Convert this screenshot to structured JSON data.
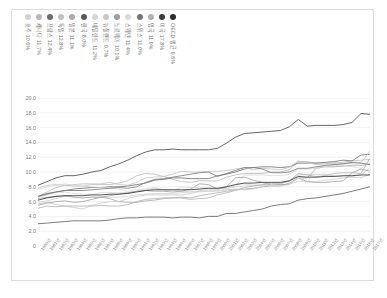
{
  "chart_data": {
    "type": "line",
    "title": "",
    "xlabel": "",
    "ylabel": "",
    "ylim": [
      0,
      20
    ],
    "ytick_labels": [
      "20.0",
      "18.0",
      "16.0",
      "14.0",
      "12.0",
      "10.0",
      "8.0",
      "6.0",
      "4.0",
      "2.0",
      "0"
    ],
    "ytick_values": [
      20,
      18,
      16,
      14,
      12,
      10,
      8,
      6,
      4,
      2,
      0
    ],
    "grid": true,
    "legend_position": "top",
    "x": [
      1980,
      1981,
      1982,
      1983,
      1984,
      1985,
      1986,
      1987,
      1988,
      1989,
      1990,
      1991,
      1992,
      1993,
      1994,
      1995,
      1996,
      1997,
      1998,
      1999,
      2000,
      2001,
      2002,
      2003,
      2004,
      2005,
      2006,
      2007,
      2008,
      2009,
      2010,
      2011,
      2012,
      2013,
      2014,
      2015,
      2016,
      2017
    ],
    "xtick_labels": [
      "1980년",
      "1981년",
      "1982년",
      "1983년",
      "1984년",
      "1985년",
      "1986년",
      "1987년",
      "1988년",
      "1989년",
      "1990년",
      "1991년",
      "1992년",
      "1993년",
      "1994년",
      "1995년",
      "1996년",
      "1997년",
      "1998년",
      "1999년",
      "2000년",
      "2001년",
      "2002년",
      "2003년",
      "2004년",
      "2005년",
      "2006년",
      "2007년",
      "2008년",
      "2009년",
      "2010년",
      "2011년",
      "2012년",
      "2013년",
      "2014년",
      "2015년",
      "2016년",
      "2017년"
    ],
    "series": [
      {
        "name": "호주",
        "label": "호주 10.6%",
        "color": "#d0d0d0",
        "final_value": 10.6,
        "values": [
          5.9,
          6.1,
          6.4,
          6.7,
          6.6,
          6.5,
          6.6,
          6.6,
          6.6,
          6.6,
          6.7,
          6.9,
          7.0,
          7.1,
          7.1,
          7.1,
          7.2,
          7.3,
          7.5,
          7.6,
          7.7,
          7.8,
          8.0,
          8.1,
          8.2,
          8.2,
          8.3,
          8.3,
          8.4,
          8.7,
          8.7,
          8.7,
          8.9,
          9.0,
          9.2,
          9.4,
          9.6,
          10.6
        ]
      },
      {
        "name": "캐나다",
        "label": "캐나다 11.7%",
        "color": "#b9b9b9",
        "final_value": 11.7,
        "values": [
          6.7,
          7.3,
          7.9,
          8.2,
          8.1,
          8.1,
          8.3,
          8.3,
          8.3,
          8.5,
          8.8,
          9.5,
          9.8,
          9.7,
          9.4,
          9.0,
          8.7,
          8.6,
          8.8,
          8.8,
          8.8,
          9.3,
          9.6,
          9.8,
          9.8,
          9.8,
          10.0,
          10.0,
          10.3,
          11.4,
          11.4,
          11.2,
          11.2,
          11.2,
          11.3,
          11.5,
          11.6,
          11.7
        ]
      },
      {
        "name": "프랑스",
        "label": "프랑스 12.4%",
        "color": "#6b6b6b",
        "final_value": 12.4,
        "values": [
          6.7,
          7.1,
          7.3,
          7.5,
          7.7,
          7.8,
          7.9,
          7.9,
          8.0,
          8.0,
          8.1,
          8.3,
          8.5,
          8.9,
          9.0,
          9.2,
          9.2,
          9.1,
          9.1,
          9.1,
          9.5,
          9.7,
          10.0,
          10.4,
          10.6,
          10.7,
          10.7,
          10.6,
          10.7,
          11.2,
          11.2,
          11.2,
          11.3,
          11.4,
          11.6,
          11.5,
          12.3,
          12.4
        ]
      },
      {
        "name": "독일",
        "label": "독일 12.8%",
        "color": "#c2c2c2",
        "final_value": 12.8,
        "values": [
          7.8,
          8.2,
          8.3,
          8.2,
          8.3,
          8.4,
          8.4,
          8.4,
          8.6,
          8.3,
          8.2,
          8.6,
          9.2,
          9.3,
          9.4,
          9.7,
          10.1,
          10.0,
          10.0,
          10.1,
          10.1,
          10.2,
          10.4,
          10.6,
          10.3,
          10.5,
          10.4,
          10.3,
          10.6,
          11.5,
          11.3,
          11.0,
          11.1,
          11.2,
          11.2,
          11.2,
          11.3,
          12.8
        ]
      },
      {
        "name": "일본",
        "label": "일본 11.1%",
        "color": "#aaaaaa",
        "final_value": 11.1,
        "values": [
          6.4,
          6.6,
          6.7,
          6.8,
          6.6,
          6.5,
          6.6,
          6.6,
          6.4,
          6.0,
          5.9,
          5.9,
          6.1,
          6.2,
          6.4,
          6.5,
          6.6,
          6.5,
          6.8,
          7.0,
          7.2,
          7.4,
          7.6,
          7.7,
          7.8,
          8.0,
          8.1,
          8.1,
          8.5,
          9.2,
          9.2,
          10.5,
          10.7,
          10.7,
          10.8,
          10.9,
          10.9,
          11.1
        ]
      },
      {
        "name": "한국",
        "label": "한국 8.0%",
        "color": "#5a5a5a",
        "final_value": 8.0,
        "values": [
          3.0,
          3.1,
          3.2,
          3.3,
          3.4,
          3.4,
          3.4,
          3.4,
          3.5,
          3.7,
          3.8,
          3.8,
          3.9,
          3.9,
          3.9,
          3.8,
          3.9,
          3.9,
          3.8,
          4.0,
          4.0,
          4.4,
          4.4,
          4.6,
          4.8,
          5.0,
          5.4,
          5.6,
          5.7,
          6.2,
          6.4,
          6.5,
          6.7,
          6.9,
          7.1,
          7.4,
          7.7,
          8.0
        ]
      },
      {
        "name": "네덜란드",
        "label": "네덜란드 11.2%",
        "color": "#d6d6d6",
        "final_value": 11.2,
        "values": [
          6.6,
          6.9,
          7.2,
          7.3,
          7.1,
          7.0,
          7.0,
          7.2,
          7.2,
          7.2,
          7.2,
          7.4,
          7.6,
          7.8,
          7.6,
          7.5,
          7.4,
          7.3,
          7.3,
          7.4,
          7.4,
          7.7,
          8.1,
          9.6,
          9.6,
          9.6,
          9.5,
          9.5,
          9.7,
          10.4,
          10.4,
          10.5,
          10.9,
          10.9,
          10.9,
          10.7,
          10.5,
          11.2
        ]
      },
      {
        "name": "뉴질랜드",
        "label": "뉴질랜드 9.7%",
        "color": "#c8c8c8",
        "final_value": 9.7,
        "values": [
          5.7,
          5.9,
          5.6,
          5.4,
          5.2,
          5.0,
          5.5,
          5.8,
          6.0,
          6.0,
          6.4,
          6.7,
          6.9,
          6.9,
          6.9,
          6.9,
          6.9,
          7.1,
          7.4,
          7.4,
          7.5,
          7.6,
          7.7,
          7.6,
          7.7,
          8.0,
          8.4,
          8.4,
          8.8,
          9.6,
          9.7,
          9.7,
          9.7,
          9.5,
          9.3,
          9.3,
          9.2,
          9.7
        ]
      },
      {
        "name": "노르웨이",
        "label": "노르웨이 10.1%",
        "color": "#9e9e9e",
        "final_value": 10.1,
        "values": [
          5.5,
          5.8,
          6.0,
          6.1,
          5.9,
          6.0,
          6.3,
          6.6,
          6.8,
          7.0,
          7.2,
          7.4,
          7.5,
          7.4,
          7.4,
          7.3,
          7.4,
          7.7,
          8.4,
          8.3,
          7.7,
          8.0,
          9.2,
          9.3,
          8.9,
          8.6,
          8.2,
          8.3,
          8.3,
          9.2,
          8.7,
          8.6,
          8.6,
          8.7,
          8.8,
          9.9,
          10.4,
          10.1
        ]
      },
      {
        "name": "스웨덴",
        "label": "스웨덴 11.4%",
        "color": "#dadada",
        "final_value": 11.4,
        "values": [
          7.6,
          8.0,
          8.2,
          8.4,
          8.2,
          8.1,
          8.0,
          7.9,
          7.8,
          7.7,
          7.4,
          7.6,
          7.7,
          7.9,
          7.6,
          7.4,
          8.0,
          7.9,
          7.9,
          7.9,
          7.4,
          7.6,
          8.3,
          8.4,
          8.2,
          8.3,
          8.2,
          8.1,
          8.3,
          9.2,
          8.5,
          10.7,
          10.8,
          11.0,
          11.1,
          11.1,
          11.0,
          11.4
        ]
      },
      {
        "name": "스위스",
        "label": "스위스 11.0%",
        "color": "#767676",
        "final_value": 11.0,
        "values": [
          6.7,
          7.0,
          7.3,
          7.5,
          7.5,
          7.5,
          7.6,
          7.7,
          7.8,
          7.9,
          7.8,
          8.0,
          8.6,
          9.0,
          9.1,
          9.3,
          9.5,
          9.7,
          9.9,
          10.0,
          9.4,
          9.8,
          10.2,
          10.6,
          10.6,
          10.4,
          9.9,
          9.9,
          10.0,
          10.5,
          10.5,
          10.7,
          10.9,
          11.0,
          11.1,
          11.3,
          11.2,
          11.0
        ]
      },
      {
        "name": "영국",
        "label": "영국 11.9%",
        "color": "#b0b0b0",
        "final_value": 11.9,
        "values": [
          5.1,
          5.4,
          5.3,
          5.4,
          5.4,
          5.4,
          5.4,
          5.5,
          5.4,
          5.4,
          5.6,
          6.0,
          6.3,
          6.4,
          6.5,
          6.5,
          6.5,
          6.3,
          6.4,
          6.5,
          6.9,
          7.2,
          7.5,
          7.9,
          8.1,
          8.3,
          8.5,
          8.5,
          8.8,
          9.8,
          9.6,
          9.4,
          9.5,
          9.8,
          9.9,
          9.9,
          9.8,
          11.9
        ]
      },
      {
        "name": "미국",
        "label": "미국 17.8%",
        "color": "#3d3d3d",
        "final_value": 17.8,
        "values": [
          8.2,
          8.7,
          9.2,
          9.5,
          9.5,
          9.7,
          10.0,
          10.2,
          10.7,
          11.1,
          11.6,
          12.2,
          12.7,
          13.0,
          13.0,
          13.1,
          13.0,
          13.0,
          13.0,
          13.0,
          13.2,
          13.9,
          14.7,
          15.2,
          15.3,
          15.4,
          15.5,
          15.6,
          16.1,
          17.1,
          16.2,
          16.3,
          16.3,
          16.3,
          16.4,
          16.7,
          17.9,
          17.8
        ]
      },
      {
        "name": "OECD 평균",
        "label": "OECD 평균 9.6%",
        "color": "#2b2b2b",
        "final_value": 9.6,
        "values": [
          6.2,
          6.5,
          6.7,
          6.8,
          6.8,
          6.8,
          6.9,
          6.9,
          7.0,
          7.0,
          7.1,
          7.3,
          7.5,
          7.6,
          7.6,
          7.6,
          7.6,
          7.6,
          7.7,
          7.8,
          7.8,
          8.0,
          8.3,
          8.5,
          8.5,
          8.6,
          8.6,
          8.6,
          8.8,
          9.4,
          9.3,
          9.3,
          9.4,
          9.4,
          9.5,
          9.5,
          9.6,
          9.6
        ]
      }
    ]
  }
}
